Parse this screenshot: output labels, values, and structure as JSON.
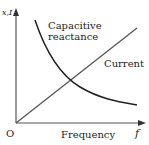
{
  "diagram": {
    "axes": {
      "y_label": "x,I",
      "x_label": "f",
      "origin_label": "O",
      "x_axis_title": "Frequency"
    },
    "curves": [
      {
        "name": "capacitive-reactance",
        "label_line1": "Capacitive",
        "label_line2": "reactance",
        "shape": "decreasing hyperbola",
        "color": "#222222"
      },
      {
        "name": "current",
        "label": "Current",
        "shape": "increasing straight line from origin",
        "color": "#555555"
      }
    ]
  }
}
